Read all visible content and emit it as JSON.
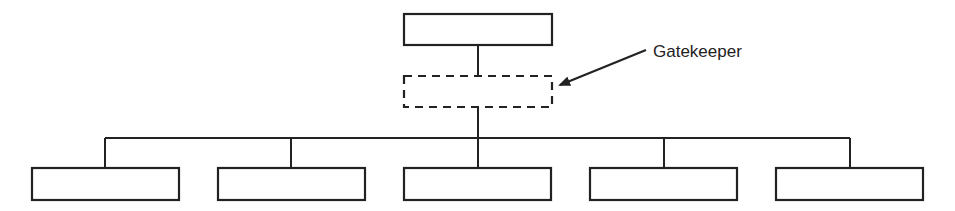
{
  "diagram": {
    "type": "org-chart",
    "stroke_color": "#222222",
    "background": "#ffffff",
    "top_node": {
      "label": "",
      "x": 404,
      "y": 14,
      "w": 148,
      "h": 31
    },
    "gatekeeper_node": {
      "label": "",
      "x": 404,
      "y": 76,
      "w": 148,
      "h": 31,
      "style": "dashed"
    },
    "annotation": {
      "text": "Gatekeeper",
      "text_x": 653,
      "text_y": 57,
      "arrow_from": [
        646,
        50
      ],
      "arrow_to": [
        558,
        86
      ]
    },
    "bus_y": 138,
    "bottom_nodes": [
      {
        "label": "",
        "x": 32,
        "w": 147,
        "cx": 105
      },
      {
        "label": "",
        "x": 218,
        "w": 147,
        "cx": 291
      },
      {
        "label": "",
        "x": 404,
        "w": 147,
        "cx": 478
      },
      {
        "label": "",
        "x": 590,
        "w": 147,
        "cx": 664
      },
      {
        "label": "",
        "x": 776,
        "w": 147,
        "cx": 850
      }
    ],
    "bottom_y": 168,
    "bottom_h": 32
  }
}
